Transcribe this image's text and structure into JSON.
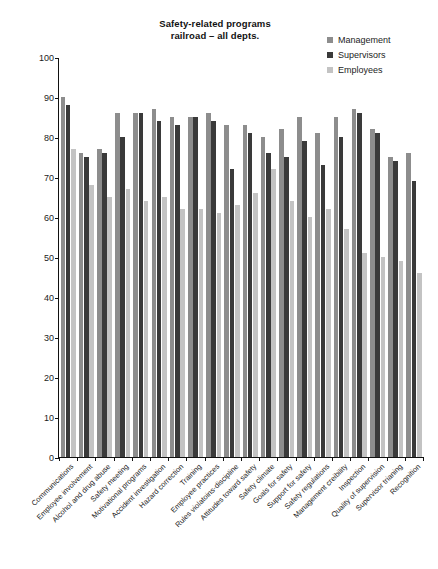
{
  "chart_data": {
    "type": "bar",
    "title": "Safety-related programs railroad – all depts.",
    "title_lines": [
      "Safety-related programs",
      "railroad – all depts."
    ],
    "xlabel": "",
    "ylabel": "",
    "ylim": [
      0,
      100
    ],
    "ytick_values": [
      0,
      10,
      20,
      30,
      40,
      50,
      60,
      70,
      80,
      90,
      100
    ],
    "grid": false,
    "legend_position": "top-right",
    "categories": [
      "Communications",
      "Employee involvement",
      "Alcohol and drug abuse",
      "Safety meeting",
      "Motivational programs",
      "Accident investigation",
      "Hazard correction",
      "Training",
      "Employee practices",
      "Rules violatoins-discipline",
      "Attitudes toward safety",
      "Safety climate",
      "Goals for safety",
      "Support for safety",
      "Safety regulations",
      "Management creibility",
      "Inspection",
      "Quality of supervision",
      "Supervisor trianing",
      "Recognition"
    ],
    "series": [
      {
        "name": "Management",
        "color": "#8d8d8d",
        "values": [
          90,
          76,
          77,
          86,
          86,
          87,
          85,
          85,
          86,
          83,
          83,
          80,
          82,
          85,
          81,
          85,
          87,
          82,
          75,
          76
        ]
      },
      {
        "name": "Supervisors",
        "color": "#3a3a3a",
        "values": [
          88,
          75,
          76,
          80,
          86,
          84,
          83,
          85,
          84,
          72,
          81,
          76,
          75,
          79,
          73,
          80,
          86,
          81,
          74,
          69
        ]
      },
      {
        "name": "Employees",
        "color": "#c3c3c3",
        "values": [
          77,
          68,
          65,
          67,
          64,
          65,
          62,
          62,
          61,
          63,
          66,
          72,
          64,
          60,
          62,
          57,
          51,
          50,
          49,
          46
        ]
      }
    ]
  },
  "legend": {
    "items": [
      {
        "label": "Management",
        "color": "#8d8d8d"
      },
      {
        "label": "Supervisors",
        "color": "#3a3a3a"
      },
      {
        "label": "Employees",
        "color": "#c3c3c3"
      }
    ]
  }
}
